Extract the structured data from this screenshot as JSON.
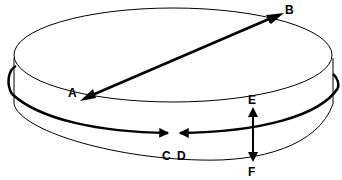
{
  "diagram": {
    "colors": {
      "stroke": "#000000",
      "background": "#ffffff"
    },
    "labels": {
      "A": "A",
      "B": "B",
      "C": "C",
      "D": "D",
      "E": "E",
      "F": "F"
    },
    "arrows": [
      {
        "id": "A-B",
        "from": "A",
        "to": "B",
        "type": "double-headed",
        "meaning": "diameter across top face"
      },
      {
        "id": "C-D",
        "from": "C",
        "to": "D",
        "type": "circumference",
        "meaning": "arrows meeting around the circumference"
      },
      {
        "id": "E-F",
        "from": "E",
        "to": "F",
        "type": "double-headed",
        "meaning": "thickness of disc"
      }
    ]
  }
}
